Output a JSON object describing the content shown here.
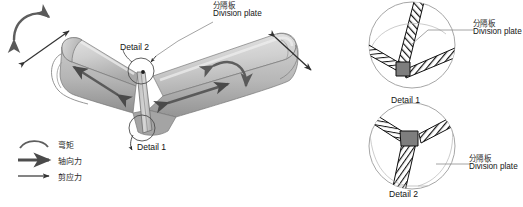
{
  "figure": {
    "type": "engineering-diagram",
    "background_color": "#ffffff",
    "member_fill_light": "#d2d2d2",
    "member_fill_mid": "#b9b9b9",
    "member_fill_dark": "#9a9a9a",
    "outline_color": "#6f6f6f",
    "arrow_color": "#5a5a5a",
    "thin_arrow_color": "#3a3a3a",
    "node_color": "#7a7a7a",
    "hatch_color": "#1a1a1a"
  },
  "main_view": {
    "division_plate_callout": {
      "cn": "分隔板",
      "en": "Division plate"
    },
    "detail_markers": [
      {
        "label": "Detail 2",
        "x": 120,
        "y": 47
      },
      {
        "label": "Detail 1",
        "x": 137,
        "y": 147
      }
    ]
  },
  "legend": {
    "items": [
      {
        "icon": "curved-double-arrow-icon",
        "cn": "弯矩",
        "en": "bending moment"
      },
      {
        "icon": "thick-arrow-icon",
        "cn": "轴向力",
        "en": "axial force"
      },
      {
        "icon": "thin-arrow-icon",
        "cn": "剪应力",
        "en": "shear stress"
      }
    ]
  },
  "details": [
    {
      "id": "detail-1",
      "title": "Detail 1",
      "callout": {
        "cn": "分隔板",
        "en": "Division plate"
      },
      "description": "Corner cross-section: two hatched wall plates meeting at a node with an inclined division plate"
    },
    {
      "id": "detail-2",
      "title": "Detail 2",
      "callout": {
        "cn": "分隔板",
        "en": "Division plate"
      },
      "description": "Y-junction cross-section: three hatched plates meeting at a central node with division plate stem"
    }
  ]
}
